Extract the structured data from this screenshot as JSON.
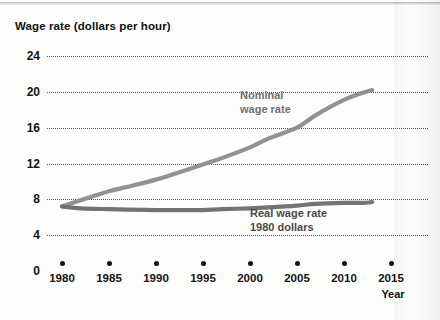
{
  "chart_data": {
    "type": "line",
    "title": "",
    "ylabel": "Wage rate (dollars per hour)",
    "xlabel": "Year",
    "ylim": [
      0,
      26
    ],
    "xlim": [
      1978.5,
      2016
    ],
    "grid": true,
    "legend_position": "inline-annotation",
    "yticks": [
      24,
      20,
      16,
      12,
      8,
      4,
      0
    ],
    "ytick_labels": [
      "24",
      "20",
      "16",
      "12",
      "8",
      "4",
      "0"
    ],
    "xticks": [
      1980,
      1985,
      1990,
      1995,
      2000,
      2005,
      2010,
      2015
    ],
    "xtick_labels": [
      "1980",
      "1985",
      "1990",
      "1995",
      "2000",
      "2005",
      "2010",
      "2015"
    ],
    "x": [
      1980,
      1982,
      1985,
      1987,
      1990,
      1993,
      1995,
      1997,
      2000,
      2002,
      2005,
      2007,
      2010,
      2012,
      2013
    ],
    "series": [
      {
        "name": "Nominal wage rate",
        "label_line1": "Nominal",
        "label_line2": "wage rate",
        "color": "#8c8c8c",
        "values": [
          7.2,
          7.9,
          8.9,
          9.4,
          10.2,
          11.2,
          11.9,
          12.6,
          13.8,
          14.8,
          16.0,
          17.4,
          19.1,
          19.9,
          20.2
        ]
      },
      {
        "name": "Real wage rate (1980 dollars)",
        "label_line1": "Real wage rate",
        "label_line2": "1980 dollars",
        "color": "#6b6b6b",
        "values": [
          7.2,
          7.0,
          6.9,
          6.85,
          6.8,
          6.8,
          6.8,
          6.9,
          7.0,
          7.1,
          7.3,
          7.5,
          7.6,
          7.6,
          7.7
        ]
      }
    ]
  },
  "axis_colors": {
    "gridline": "#3a3a3a",
    "tick_text": "#141414",
    "annotation": "#6f6f6f"
  },
  "scan_artifact": {
    "bleed_text": ""
  }
}
